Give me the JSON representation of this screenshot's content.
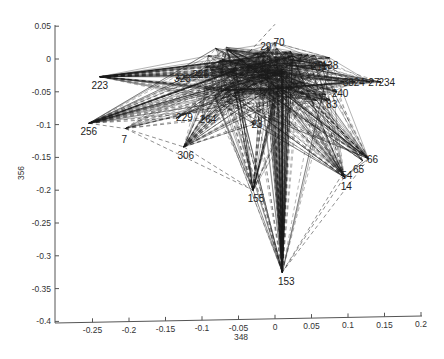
{
  "chart_data": {
    "type": "scatter",
    "subtype": "network-projection-graph",
    "title": "",
    "xlabel": "348",
    "ylabel": "356",
    "xlim": [
      -0.3,
      0.2
    ],
    "ylim": [
      -0.4,
      0.05
    ],
    "x_ticks": [
      "-0.25",
      "-0.2",
      "-0.15",
      "-0.1",
      "-0.05",
      "0",
      "0.05",
      "0.1",
      "0.15",
      "0.2"
    ],
    "x_tick_values": [
      -0.25,
      -0.2,
      -0.15,
      -0.1,
      -0.05,
      0,
      0.05,
      0.1,
      0.15,
      0.2
    ],
    "y_ticks": [
      "0.05",
      "0",
      "-0.05",
      "-0.1",
      "-0.15",
      "-0.2",
      "-0.25",
      "-0.3",
      "-0.35",
      "-0.4"
    ],
    "y_tick_values": [
      0.05,
      0,
      -0.05,
      -0.1,
      -0.15,
      -0.2,
      -0.25,
      -0.3,
      -0.35,
      -0.4
    ],
    "grid": false,
    "legend": null,
    "edge_styles": [
      "solid",
      "dashed"
    ],
    "line_color": "#1a1a1a",
    "nodes": [
      {
        "id": "hub",
        "label": "",
        "x": 0.0,
        "y": -0.005
      },
      {
        "id": "223",
        "label": "223",
        "x": -0.24,
        "y": -0.027
      },
      {
        "id": "256",
        "label": "256",
        "x": -0.255,
        "y": -0.098
      },
      {
        "id": "7",
        "label": "7",
        "x": -0.205,
        "y": -0.106
      },
      {
        "id": "306",
        "label": "306",
        "x": -0.125,
        "y": -0.134
      },
      {
        "id": "264",
        "label": "264",
        "x": -0.1,
        "y": -0.093
      },
      {
        "id": "229",
        "label": "229",
        "x": -0.135,
        "y": -0.09
      },
      {
        "id": "226",
        "label": "226",
        "x": -0.11,
        "y": -0.025
      },
      {
        "id": "323",
        "label": "323",
        "x": -0.135,
        "y": -0.03
      },
      {
        "id": "23",
        "label": "23",
        "x": -0.03,
        "y": -0.1
      },
      {
        "id": "155",
        "label": "155",
        "x": -0.03,
        "y": -0.2
      },
      {
        "id": "153",
        "label": "153",
        "x": 0.01,
        "y": -0.325
      },
      {
        "id": "14",
        "label": "14",
        "x": 0.095,
        "y": -0.18
      },
      {
        "id": "54",
        "label": "54",
        "x": 0.093,
        "y": -0.174
      },
      {
        "id": "65",
        "label": "65",
        "x": 0.12,
        "y": -0.155
      },
      {
        "id": "66",
        "label": "66",
        "x": 0.128,
        "y": -0.152
      },
      {
        "id": "240",
        "label": "240",
        "x": 0.085,
        "y": -0.05
      },
      {
        "id": "83",
        "label": "83",
        "x": 0.075,
        "y": -0.062
      },
      {
        "id": "138",
        "label": "138",
        "x": 0.07,
        "y": -0.01
      },
      {
        "id": "211",
        "label": "211",
        "x": 0.055,
        "y": -0.012
      },
      {
        "id": "27",
        "label": "27",
        "x": 0.13,
        "y": -0.035
      },
      {
        "id": "234",
        "label": "234",
        "x": 0.145,
        "y": -0.035
      },
      {
        "id": "38",
        "label": "38",
        "x": 0.095,
        "y": -0.035
      },
      {
        "id": "24",
        "label": "24",
        "x": 0.11,
        "y": -0.035
      },
      {
        "id": "70",
        "label": "70",
        "x": 0.0,
        "y": 0.025
      },
      {
        "id": "29",
        "label": "29",
        "x": -0.01,
        "y": 0.018
      }
    ],
    "edges_note": "Dense web of solid and dashed edges radiating from a hub near (0,0) to all peripheral nodes; additional edges connect peripheral nodes (e.g. 7-306, 306-155, 256-153 region, 14-153, 66-153)."
  }
}
